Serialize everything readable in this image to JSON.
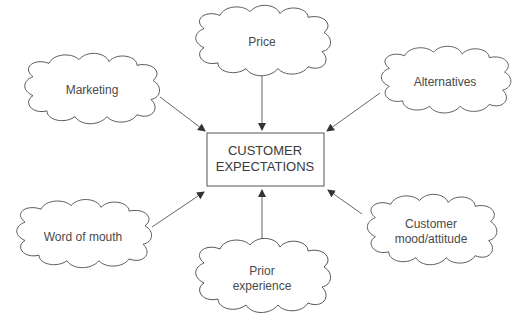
{
  "diagram": {
    "center": {
      "line1": "CUSTOMER",
      "line2": "EXPECTATIONS"
    },
    "nodes": [
      {
        "id": "price",
        "line1": "Price",
        "line2": ""
      },
      {
        "id": "marketing",
        "line1": "Marketing",
        "line2": ""
      },
      {
        "id": "alternatives",
        "line1": "Alternatives",
        "line2": ""
      },
      {
        "id": "word-of-mouth",
        "line1": "Word of mouth",
        "line2": ""
      },
      {
        "id": "customer-mood",
        "line1": "Customer",
        "line2": "mood/attitude"
      },
      {
        "id": "prior-experience",
        "line1": "Prior",
        "line2": "experience"
      }
    ],
    "colors": {
      "stroke": "#555555",
      "text": "#4a4a4a",
      "background": "#ffffff"
    }
  }
}
